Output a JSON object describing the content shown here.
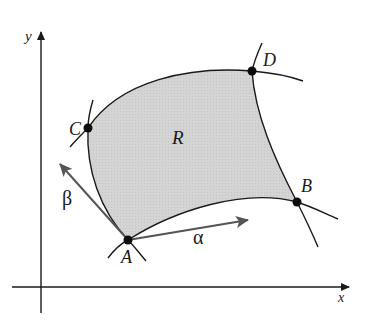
{
  "figure": {
    "axes": {
      "x_label": "x",
      "y_label": "y"
    },
    "region": {
      "label": "R",
      "fill_color": "#d2d2d2"
    },
    "points": [
      {
        "id": "A",
        "label": "A"
      },
      {
        "id": "B",
        "label": "B"
      },
      {
        "id": "C",
        "label": "C"
      },
      {
        "id": "D",
        "label": "D"
      }
    ],
    "vectors": [
      {
        "id": "alpha",
        "label": "α",
        "color": "#555555"
      },
      {
        "id": "beta",
        "label": "β",
        "color": "#555555"
      }
    ],
    "colors": {
      "ink": "#1a1a1a",
      "vector": "#555555",
      "shade": "#d2d2d2"
    }
  }
}
